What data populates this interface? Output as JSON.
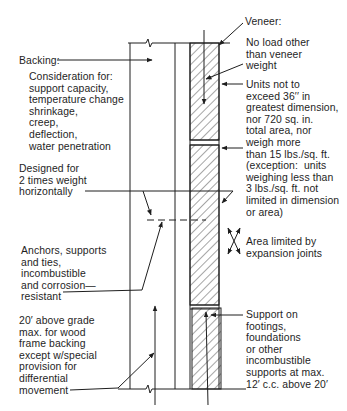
{
  "diagram": {
    "type": "wall-section",
    "labels": {
      "backing": {
        "title": "Backing:",
        "body": "Consideration for:\nsupport capacity,\ntemperature change\nshrinkage,\ncreep,\ndeflection,\nwater penetration"
      },
      "designed": "Designed for\n2 times weight\nhorizontally",
      "anchors": "Anchors, supports\nand ties,\nincombustible\nand corrosion—\nresistant",
      "height_limit": "20′ above grade\nmax. for wood\nframe backing\nexcept w/special\nprovision for\ndifferential\nmovement",
      "veneer": {
        "title": "Veneer:",
        "body": "No load other\nthan veneer\nweight"
      },
      "units": "Units not to\nexceed 36′′ in\ngreatest dimension,\nnor 720 sq. in.\ntotal area, nor\nweigh more\nthan 15 lbs./sq. ft.\n(exception:  units\nweighing less than\n3 lbs./sq. ft. not\nlimited in dimension\nor area)",
      "expansion": "Area limited by\nexpansion joints",
      "support": "Support on\nfootings,\nfoundations\nor other\nincombustible\nsupports at max.\n12′ c.c. above 20′"
    },
    "icons": {
      "break_line": "zigzag-break-icon",
      "expansion": "crossed-arrows-icon"
    },
    "colors": {
      "line": "#1e1e1e",
      "hatch": "#3a3a3a",
      "background": "#ffffff"
    }
  }
}
